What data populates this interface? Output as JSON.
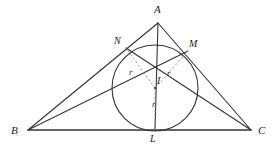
{
  "figure": {
    "type": "geometry-diagram",
    "background_color": "#ffffff",
    "stroke_color": "#333333",
    "dashed_color": "#8a8a8a"
  },
  "labels": {
    "vertex_a": "A",
    "vertex_b": "B",
    "vertex_c": "C",
    "tangent_l": "L",
    "tangent_m": "M",
    "tangent_n": "N",
    "incenter": "I",
    "radius_left": "r",
    "radius_right": "r",
    "radius_bottom": "r"
  },
  "geometry": {
    "vertices": {
      "A": [
        158,
        23
      ],
      "B": [
        28,
        130
      ],
      "C": [
        251,
        130
      ]
    },
    "incenter": [
      155,
      88
    ],
    "inradius": 43,
    "tangent_points": {
      "L": [
        155,
        130
      ],
      "M": [
        188,
        51
      ],
      "N": [
        126,
        48
      ]
    },
    "solid_segments": [
      [
        "B",
        "A"
      ],
      [
        "A",
        "C"
      ],
      [
        "B",
        "C"
      ],
      [
        "A",
        "L"
      ],
      [
        "B",
        "M"
      ],
      [
        "C",
        "N"
      ]
    ],
    "dashed_segments": [
      [
        "I",
        "N"
      ],
      [
        "I",
        "M"
      ],
      [
        "I",
        "L"
      ]
    ],
    "circle": {
      "center": [
        155,
        88
      ],
      "radius": 43
    }
  },
  "label_positions": {
    "A": [
      154,
      4
    ],
    "B": [
      11,
      126
    ],
    "C": [
      258,
      126
    ],
    "L": [
      150,
      136
    ],
    "M": [
      190,
      40
    ],
    "N": [
      114,
      37
    ],
    "I": [
      157,
      76
    ],
    "r_left": [
      129,
      68
    ],
    "r_right": [
      167,
      69
    ],
    "r_bottom": [
      152,
      100
    ]
  }
}
